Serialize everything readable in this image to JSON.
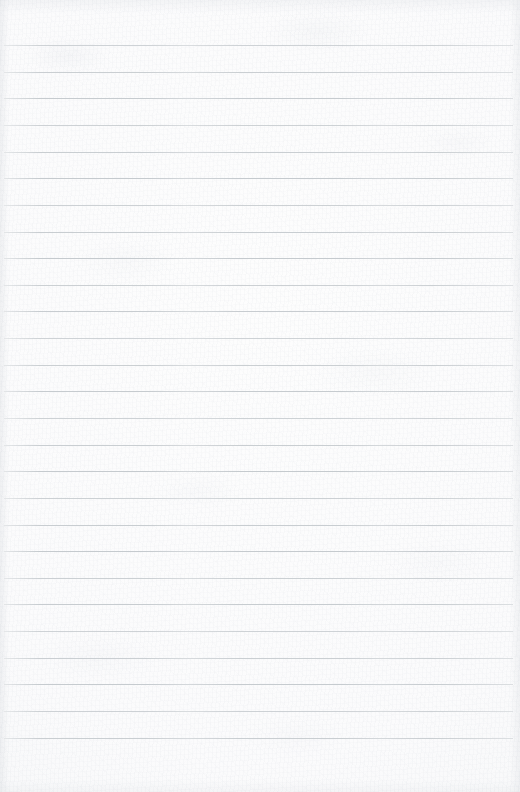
{
  "document": {
    "kind": "scanned-lined-notebook-page",
    "title": "",
    "body_text": "",
    "page_number": "",
    "header_text": "",
    "footer_text": ""
  },
  "page": {
    "width": 520,
    "height": 792,
    "paper_color": "#fbfbfc",
    "paper_edge_shade": "#f1f2f4",
    "is_blank": true
  },
  "ruling": {
    "line_color": "#c5cace",
    "line_thickness_px": 1,
    "line_count": 27,
    "first_line_y": 45,
    "line_spacing_px": 26.65,
    "line_left_x": 4,
    "line_right_x": 513,
    "has_vertical_margin_rule": false,
    "lines": [
      {
        "y": 45,
        "left": 4,
        "right": 513
      },
      {
        "y": 72,
        "left": 4,
        "right": 513
      },
      {
        "y": 98,
        "left": 4,
        "right": 513
      },
      {
        "y": 125,
        "left": 4,
        "right": 513
      },
      {
        "y": 152,
        "left": 4,
        "right": 513
      },
      {
        "y": 178,
        "left": 4,
        "right": 513
      },
      {
        "y": 205,
        "left": 4,
        "right": 513
      },
      {
        "y": 232,
        "left": 4,
        "right": 513
      },
      {
        "y": 258,
        "left": 4,
        "right": 513
      },
      {
        "y": 285,
        "left": 4,
        "right": 513
      },
      {
        "y": 311,
        "left": 4,
        "right": 513
      },
      {
        "y": 338,
        "left": 4,
        "right": 513
      },
      {
        "y": 365,
        "left": 4,
        "right": 513
      },
      {
        "y": 391,
        "left": 4,
        "right": 513
      },
      {
        "y": 418,
        "left": 4,
        "right": 513
      },
      {
        "y": 445,
        "left": 4,
        "right": 513
      },
      {
        "y": 471,
        "left": 4,
        "right": 513
      },
      {
        "y": 498,
        "left": 4,
        "right": 513
      },
      {
        "y": 525,
        "left": 4,
        "right": 513
      },
      {
        "y": 551,
        "left": 4,
        "right": 513
      },
      {
        "y": 578,
        "left": 4,
        "right": 513
      },
      {
        "y": 604,
        "left": 4,
        "right": 513
      },
      {
        "y": 631,
        "left": 4,
        "right": 513
      },
      {
        "y": 658,
        "left": 4,
        "right": 513
      },
      {
        "y": 684,
        "left": 4,
        "right": 513
      },
      {
        "y": 711,
        "left": 4,
        "right": 513
      },
      {
        "y": 738,
        "left": 4,
        "right": 513
      }
    ]
  },
  "margins": {
    "top_px": 45,
    "bottom_px": 54,
    "left_px": 4,
    "right_px": 7
  }
}
